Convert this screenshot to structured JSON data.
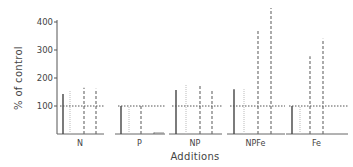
{
  "chart_data": {
    "type": "bar",
    "title": "",
    "xlabel": "Additions",
    "ylabel": "% of control",
    "ylim": [
      0,
      450
    ],
    "yticks": [
      100,
      200,
      300,
      400
    ],
    "grid": false,
    "legend": null,
    "reference_line": {
      "value": 100,
      "style": "dotted"
    },
    "categories": [
      "N",
      "P",
      "NP",
      "NPFe",
      "Fe"
    ],
    "series": [
      {
        "name": "series-1",
        "style": "solid",
        "values": [
          143,
          100,
          157,
          160,
          100
        ]
      },
      {
        "name": "series-2",
        "style": "dotted-light",
        "values": [
          157,
          100,
          178,
          160,
          100
        ]
      },
      {
        "name": "series-3",
        "style": "dashed",
        "values": [
          165,
          105,
          178,
          368,
          278
        ]
      },
      {
        "name": "series-4",
        "style": "dashed",
        "values": [
          162,
          5,
          160,
          450,
          340
        ]
      }
    ]
  },
  "axis": {
    "y_title": "% of control",
    "x_title": "Additions",
    "y_ticks": [
      "100",
      "200",
      "300",
      "400"
    ],
    "categories": [
      "N",
      "P",
      "NP",
      "NPFe",
      "Fe"
    ]
  }
}
